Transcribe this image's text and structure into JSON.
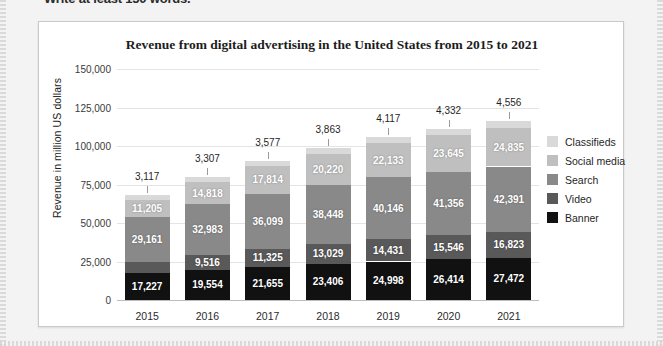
{
  "top_instruction": "Write at least 150 words.",
  "chart_card": {
    "title": "Revenue from digital advertising in the United States from 2015 to 2021"
  },
  "legend": {
    "items": [
      {
        "label": "Classifieds",
        "color": "#d9d9d9"
      },
      {
        "label": "Social media",
        "color": "#bfbfbf"
      },
      {
        "label": "Search",
        "color": "#898989"
      },
      {
        "label": "Video",
        "color": "#595959"
      },
      {
        "label": "Banner",
        "color": "#111111"
      }
    ]
  },
  "chart_data": {
    "type": "bar",
    "stacked": true,
    "title": "Revenue from digital advertising in the United States from 2015 to 2021",
    "xlabel": "",
    "ylabel": "Revenue in million US dollars",
    "ylim": [
      0,
      150000
    ],
    "yticks": [
      0,
      25000,
      50000,
      75000,
      100000,
      125000,
      150000
    ],
    "ytick_labels": [
      "0",
      "25,000",
      "50,000",
      "75,000",
      "100,000",
      "125,000",
      "150,000"
    ],
    "grid": true,
    "legend_position": "right",
    "categories": [
      "2015",
      "2016",
      "2017",
      "2018",
      "2019",
      "2020",
      "2021"
    ],
    "series": [
      {
        "name": "Banner",
        "color": "#111111",
        "values": [
          17227,
          19554,
          21655,
          23406,
          24998,
          26414,
          27472
        ],
        "labels": [
          "17,227",
          "19,554",
          "21,655",
          "23,406",
          "24,998",
          "26,414",
          "27,472"
        ]
      },
      {
        "name": "Video",
        "color": "#595959",
        "values": [
          7537,
          9516,
          11325,
          13029,
          14431,
          15546,
          16823
        ],
        "labels": [
          "7,537",
          "9,516",
          "11,325",
          "13,029",
          "14,431",
          "15,546",
          "16,823"
        ]
      },
      {
        "name": "Search",
        "color": "#898989",
        "values": [
          29161,
          32983,
          36099,
          38448,
          40146,
          41356,
          42391
        ],
        "labels": [
          "29,161",
          "32,983",
          "36,099",
          "38,448",
          "40,146",
          "41,356",
          "42,391"
        ]
      },
      {
        "name": "Social media",
        "color": "#bfbfbf",
        "values": [
          11205,
          14818,
          17814,
          20220,
          22133,
          23645,
          24835
        ],
        "labels": [
          "11,205",
          "14,818",
          "17,814",
          "20,220",
          "22,133",
          "23,645",
          "24,835"
        ]
      },
      {
        "name": "Classifieds",
        "color": "#d9d9d9",
        "values": [
          3117,
          3307,
          3577,
          3863,
          4117,
          4332,
          4556
        ],
        "labels": [
          "3,117",
          "3,307",
          "3,577",
          "3,863",
          "4,117",
          "4,332",
          "4,556"
        ]
      }
    ],
    "top_annotations": [
      "3,117",
      "3,307",
      "3,577",
      "3,863",
      "4,117",
      "4,332",
      "4,556"
    ]
  }
}
